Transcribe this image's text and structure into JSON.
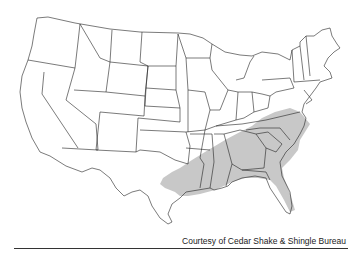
{
  "map": {
    "title": "US map showing region (shaded) in southeastern United States",
    "shade_color": "#c8c8c8",
    "line_color": "#222222",
    "shaded_states": [
      "Virginia",
      "North Carolina",
      "South Carolina",
      "Georgia",
      "Florida",
      "Alabama",
      "Mississippi",
      "Louisiana",
      "Tennessee (southeast)",
      "Texas (east)",
      "Kentucky (southeast)",
      "Arkansas (south)",
      "Maryland (east)"
    ]
  },
  "caption": "Courtesy of Cedar Shake & Shingle Bureau"
}
